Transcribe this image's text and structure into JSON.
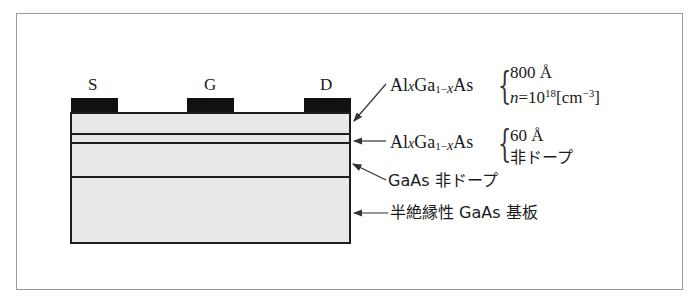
{
  "diagram": {
    "contacts": [
      {
        "id": "source",
        "label": "S"
      },
      {
        "id": "gate",
        "label": "G"
      },
      {
        "id": "drain",
        "label": "D"
      }
    ],
    "layers": [
      {
        "id": "doped-algaas",
        "material_parts": {
          "a": "Al",
          "x1": "x",
          "b": "Ga",
          "sub": "1−",
          "x2": "x",
          "c": "As"
        },
        "spec_line1": "800 Å",
        "spec_line2_prefix": "n",
        "spec_line2_eq": "=10",
        "spec_line2_exp": "18",
        "spec_line2_unit_open": "[cm",
        "spec_line2_unit_exp": "−3",
        "spec_line2_unit_close": "]"
      },
      {
        "id": "spacer-algaas",
        "material_parts": {
          "a": "Al",
          "x1": "x",
          "b": "Ga",
          "sub": "1−",
          "x2": "x",
          "c": "As"
        },
        "spec_line1": "60 Å",
        "spec_line2": "非ドープ"
      },
      {
        "id": "undoped-gaas",
        "label": "GaAs 非ドープ"
      },
      {
        "id": "substrate",
        "label": "半絶縁性 GaAs 基板"
      }
    ],
    "colors": {
      "layer_fill": "#e8e8e8",
      "contact_fill": "#111111",
      "line": "#1e1e1e",
      "frame": "#9a9a9a"
    }
  }
}
